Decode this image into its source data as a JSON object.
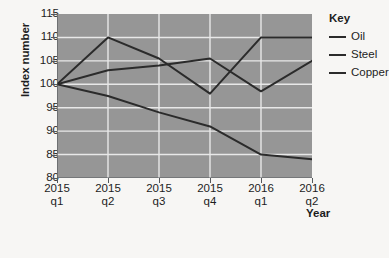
{
  "chart_data": {
    "type": "line",
    "title": "",
    "xlabel": "Year",
    "ylabel": "Index number",
    "categories": [
      "2015 q1",
      "2015 q2",
      "2015 q3",
      "2015 q4",
      "2016 q1",
      "2016 q2"
    ],
    "x_tick_lines": [
      {
        "year": "2015",
        "quarter": "q1"
      },
      {
        "year": "2015",
        "quarter": "q2"
      },
      {
        "year": "2015",
        "quarter": "q3"
      },
      {
        "year": "2015",
        "quarter": "q4"
      },
      {
        "year": "2016",
        "quarter": "q1"
      },
      {
        "year": "2016",
        "quarter": "q2"
      }
    ],
    "yticks": [
      80,
      85,
      90,
      95,
      100,
      105,
      110,
      115
    ],
    "ylim": [
      80,
      115
    ],
    "grid": true,
    "legend_position": "right",
    "legend_title": "Key",
    "series": [
      {
        "name": "Oil",
        "values": [
          100,
          97.5,
          94,
          91,
          85,
          84
        ],
        "color": "#2b2b2b"
      },
      {
        "name": "Steel",
        "values": [
          100,
          110,
          105.5,
          98,
          110,
          110
        ],
        "color": "#2b2b2b"
      },
      {
        "name": "Copper",
        "values": [
          100,
          103,
          104,
          105.5,
          98.5,
          105
        ],
        "color": "#2b2b2b"
      }
    ]
  },
  "style": {
    "plot_background": "#969696",
    "page_background": "#f7f6f4",
    "grid_color": "#e8e8e8",
    "axis_color": "#55585c",
    "line_color": "#2b2b2b"
  }
}
